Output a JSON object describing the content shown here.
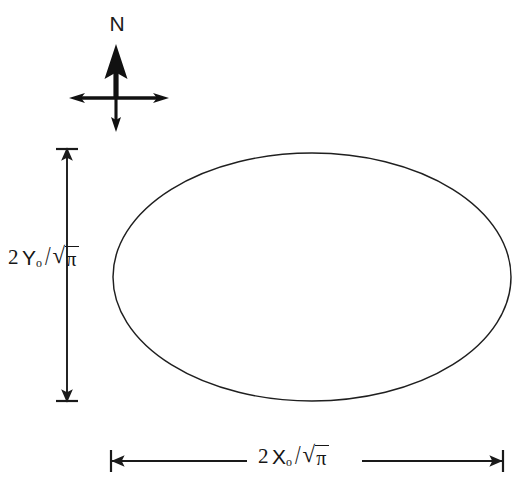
{
  "figure": {
    "type": "technical-diagram",
    "background_color": "#ffffff",
    "line_color": "#1a1a1a"
  },
  "compass": {
    "north_label": "N",
    "icon": "compass-rose-icon",
    "center": {
      "x": 116,
      "y": 98
    },
    "north_arrow_length": 46,
    "south_arrow_length": 30,
    "east_arrow_length": 52,
    "west_arrow_length": 46
  },
  "ellipse": {
    "center": {
      "x": 312,
      "y": 277
    },
    "radius_x": 199,
    "radius_y": 124,
    "stroke_width": 1.4,
    "fill": "none"
  },
  "vertical_dimension": {
    "label_full": "2Y₀/√π",
    "coefficient": "2",
    "variable": "Y",
    "subscript": "o",
    "divider": "/",
    "radical_sign": "√",
    "radicand": "π",
    "line_x": 67,
    "top_y": 150,
    "bottom_y": 400,
    "cap_style": "arrow-into-tick-bar",
    "tick_half_width": 11
  },
  "horizontal_dimension": {
    "label_full": "2X₀/√π",
    "coefficient": "2",
    "variable": "X",
    "subscript": "o",
    "divider": "/",
    "radical_sign": "√",
    "radicand": "π",
    "line_y": 461,
    "left_x": 111,
    "right_x": 503,
    "cap_style": "arrow-into-tick-bar",
    "tick_half_height": 11,
    "label_gap": {
      "start": 248,
      "end": 360
    }
  }
}
